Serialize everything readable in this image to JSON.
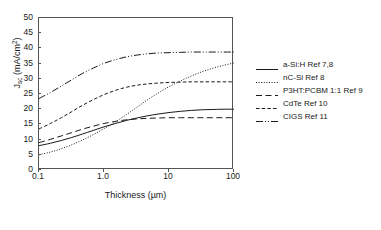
{
  "chart_data": {
    "type": "line",
    "title": "",
    "xlabel": "Thickness (µm)",
    "ylabel": "Jsc (mA/cm2)",
    "ylabel_main": "J",
    "ylabel_sub": "sc",
    "ylabel_unit": " (mA/cm",
    "ylabel_sup": "2",
    "ylabel_close": ")",
    "xscale": "log",
    "xlim": [
      0.1,
      100
    ],
    "ylim": [
      0,
      50
    ],
    "yticks": [
      50,
      45,
      40,
      35,
      30,
      25,
      20,
      15,
      10,
      5,
      0
    ],
    "xticks": [
      "0.1",
      "1.0",
      "10",
      "100"
    ],
    "xtick_values": [
      0.1,
      1.0,
      10,
      100
    ],
    "grid": false,
    "legend_position": "right",
    "series": [
      {
        "name": "a-Si:H Ref 7,8",
        "style": "solid",
        "x": [
          0.1,
          0.15,
          0.22,
          0.32,
          0.46,
          0.68,
          1.0,
          1.5,
          2.2,
          3.2,
          4.6,
          6.8,
          10,
          15,
          22,
          32,
          46,
          68,
          100
        ],
        "y": [
          8.0,
          8.8,
          9.7,
          10.7,
          11.8,
          13.0,
          14.2,
          15.3,
          16.3,
          17.1,
          17.8,
          18.4,
          18.9,
          19.3,
          19.6,
          19.8,
          19.9,
          20.0,
          20.0
        ]
      },
      {
        "name": "nC-Si Ref 8",
        "style": "dotted",
        "x": [
          0.1,
          0.15,
          0.22,
          0.32,
          0.46,
          0.68,
          1.0,
          1.5,
          2.2,
          3.2,
          4.6,
          6.8,
          10,
          15,
          22,
          32,
          46,
          68,
          100
        ],
        "y": [
          5.0,
          5.9,
          7.0,
          8.3,
          9.8,
          11.6,
          13.6,
          15.8,
          18.2,
          20.6,
          23.0,
          25.3,
          27.4,
          29.3,
          30.9,
          32.3,
          33.4,
          34.4,
          35.2
        ]
      },
      {
        "name": "P3HT:PCBM 1:1 Ref 9",
        "style": "longdash",
        "x": [
          0.1,
          0.15,
          0.22,
          0.32,
          0.46,
          0.68,
          1.0,
          1.5,
          2.2,
          3.2,
          4.6,
          6.8,
          10,
          15,
          22,
          32,
          46,
          68,
          100
        ],
        "y": [
          9.0,
          10.1,
          11.2,
          12.3,
          13.4,
          14.4,
          15.3,
          16.0,
          16.5,
          16.8,
          17.0,
          17.1,
          17.2,
          17.2,
          17.2,
          17.2,
          17.2,
          17.2,
          17.2
        ]
      },
      {
        "name": "CdTe Ref 10",
        "style": "dash",
        "x": [
          0.1,
          0.15,
          0.22,
          0.32,
          0.46,
          0.68,
          1.0,
          1.5,
          2.2,
          3.2,
          4.6,
          6.8,
          10,
          15,
          22,
          32,
          46,
          68,
          100
        ],
        "y": [
          13.5,
          15.3,
          17.2,
          19.2,
          21.2,
          23.1,
          24.8,
          26.2,
          27.2,
          27.9,
          28.3,
          28.6,
          28.8,
          28.9,
          29.0,
          29.0,
          29.0,
          29.0,
          29.0
        ]
      },
      {
        "name": "CIGS Ref 11",
        "style": "dashdotdot",
        "x": [
          0.1,
          0.15,
          0.22,
          0.32,
          0.46,
          0.68,
          1.0,
          1.5,
          2.2,
          3.2,
          4.6,
          6.8,
          10,
          15,
          22,
          32,
          46,
          68,
          100
        ],
        "y": [
          23.5,
          25.5,
          27.6,
          29.7,
          31.7,
          33.5,
          35.1,
          36.3,
          37.2,
          37.8,
          38.2,
          38.5,
          38.6,
          38.7,
          38.8,
          38.8,
          38.8,
          38.8,
          38.8
        ]
      }
    ]
  },
  "legend": {
    "items": [
      {
        "label": "a-Si:H Ref 7,8",
        "style": "solid"
      },
      {
        "label": "nC-Si Ref 8",
        "style": "dotted"
      },
      {
        "label": "P3HT:PCBM 1:1 Ref 9",
        "style": "longdash"
      },
      {
        "label": "CdTe Ref 10",
        "style": "dash"
      },
      {
        "label": "CIGS Ref 11",
        "style": "dashdotdot"
      }
    ]
  },
  "colors": {
    "axis": "#555555",
    "line": "#1a1a1a",
    "background": "#ffffff"
  }
}
